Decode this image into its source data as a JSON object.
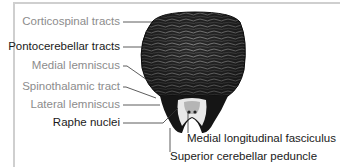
{
  "figure": {
    "colors": {
      "frame": "#cfcfcf",
      "label_gray": "#8c8c8c",
      "label_dark": "#1a1a1a",
      "leader_line": "#333333"
    },
    "labels_left": [
      {
        "id": "corticospinal",
        "text": "Corticospinal tracts",
        "tone": "gray"
      },
      {
        "id": "pontocerebellar",
        "text": "Pontocerebellar tracts",
        "tone": "dark"
      },
      {
        "id": "medial-lemniscus",
        "text": "Medial lemniscus",
        "tone": "gray"
      },
      {
        "id": "spinothalamic",
        "text": "Spinothalamic tract",
        "tone": "gray"
      },
      {
        "id": "lateral-lemniscus",
        "text": "Lateral lemniscus",
        "tone": "gray"
      },
      {
        "id": "raphe",
        "text": "Raphe nuclei",
        "tone": "dark"
      }
    ],
    "labels_bottom": [
      {
        "id": "mlf",
        "text": "Medial longitudinal fasciculus",
        "tone": "dark"
      },
      {
        "id": "scp",
        "text": "Superior cerebellar peduncle",
        "tone": "dark"
      }
    ]
  }
}
